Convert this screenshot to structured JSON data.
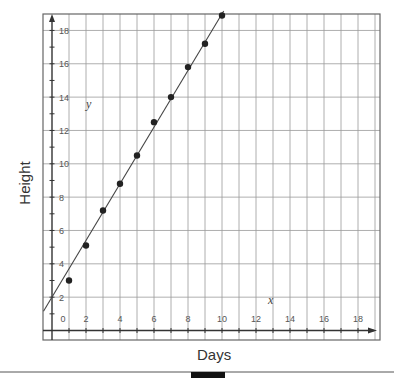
{
  "chart_data": {
    "type": "scatter",
    "title": "",
    "xlabel": "Days",
    "ylabel": "Height",
    "x_axis_var": "x",
    "y_axis_var": "y",
    "xlim": [
      -0.5,
      19
    ],
    "ylim": [
      -0.5,
      19
    ],
    "x_ticks": [
      0,
      2,
      4,
      6,
      8,
      10,
      12,
      14,
      16,
      18
    ],
    "y_ticks": [
      2,
      4,
      6,
      8,
      10,
      12,
      14,
      16,
      18
    ],
    "grid": true,
    "legend": null,
    "points": {
      "x": [
        1,
        2,
        3,
        4,
        5,
        6,
        7,
        8,
        9,
        10
      ],
      "y": [
        3.0,
        5.1,
        7.2,
        8.8,
        10.5,
        12.5,
        14.0,
        15.8,
        17.2,
        18.9
      ]
    },
    "trend_line": {
      "slope": 1.7,
      "intercept": 2.0,
      "x_start": -0.5,
      "x_end": 10.1
    }
  },
  "labels": {
    "xlabel": "Days",
    "ylabel": "Height",
    "x_var": "x",
    "y_var": "y",
    "origin": "0"
  },
  "colors": {
    "grid": "#9a9a9a",
    "axis": "#333333",
    "points": "#222222",
    "line": "#444444",
    "frame": "#666666"
  }
}
